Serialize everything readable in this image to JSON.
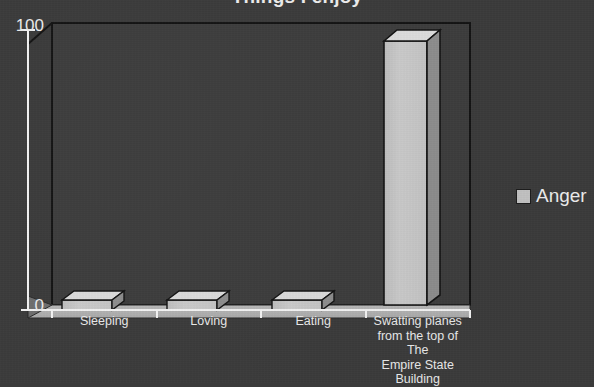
{
  "chart_data": {
    "type": "bar",
    "title": "Things I enjoy",
    "categories": [
      "Sleeping",
      "Loving",
      "Eating",
      "Swatting planes\nfrom the top of The\nEmpire State\nBuilding"
    ],
    "values": [
      1,
      1,
      1,
      100
    ],
    "series": [
      {
        "name": "Anger",
        "values": [
          1,
          1,
          1,
          100
        ]
      }
    ],
    "xlabel": "",
    "ylabel": "",
    "ylim": [
      0,
      100
    ],
    "ytick_labels": [
      "100",
      "0"
    ],
    "grid": false,
    "legend_position": "right",
    "style": "3d-column",
    "background_color": "#3b3b3b",
    "bar_front_color": "#c8c8c8",
    "bar_top_color": "#dcdcdc",
    "bar_side_color": "#8d8d8d",
    "axis_color": "#f2f2f2",
    "text_color": "#ededed"
  },
  "axis": {
    "y_max_label": "100",
    "y_min_label": "0"
  },
  "categories": [
    {
      "label_lines": [
        "Sleeping"
      ]
    },
    {
      "label_lines": [
        "Loving"
      ]
    },
    {
      "label_lines": [
        "Eating"
      ]
    },
    {
      "label_lines": [
        "Swatting planes",
        "from the top of The",
        "Empire State",
        "Building"
      ]
    }
  ],
  "legend": {
    "items": [
      {
        "label": "Anger",
        "color": "#c2c2c2"
      }
    ]
  }
}
